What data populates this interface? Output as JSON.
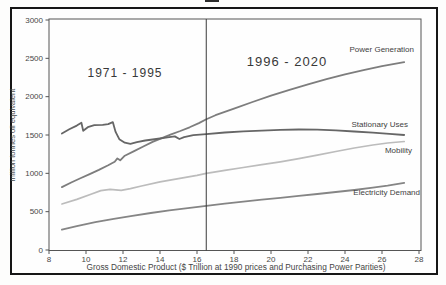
{
  "figure": {
    "cropped_top_fragment": "",
    "border_color": "#161616"
  },
  "chart_data": {
    "type": "line",
    "title": "",
    "xlabel": "Gross Domestic Product ($ Trillion at 1990 prices and Purchasing Power Parities)",
    "ylabel": "million tonnes oil equivalent",
    "xlim": [
      8,
      28
    ],
    "ylim": [
      0,
      3000
    ],
    "x_ticks": [
      8,
      10,
      12,
      14,
      16,
      18,
      20,
      22,
      24,
      26,
      28
    ],
    "y_ticks": [
      0,
      500,
      1000,
      1500,
      2000,
      2500,
      3000
    ],
    "grid": "off",
    "divider_x": 16.5,
    "annotations": [
      {
        "text": "1971 - 1995"
      },
      {
        "text": "1996 - 2020"
      }
    ],
    "series": [
      {
        "name": "Power Generation",
        "color": "#7d7d7d",
        "width": 1.8,
        "points": [
          [
            8.7,
            820
          ],
          [
            9.2,
            880
          ],
          [
            9.7,
            935
          ],
          [
            10.2,
            990
          ],
          [
            10.7,
            1045
          ],
          [
            11.2,
            1105
          ],
          [
            11.55,
            1150
          ],
          [
            11.7,
            1195
          ],
          [
            11.85,
            1170
          ],
          [
            12.1,
            1230
          ],
          [
            12.6,
            1290
          ],
          [
            13.1,
            1350
          ],
          [
            13.6,
            1410
          ],
          [
            14.1,
            1460
          ],
          [
            14.6,
            1508
          ],
          [
            15.1,
            1552
          ],
          [
            15.6,
            1600
          ],
          [
            16.1,
            1655
          ],
          [
            16.5,
            1705
          ],
          [
            17,
            1758
          ],
          [
            18,
            1845
          ],
          [
            19,
            1930
          ],
          [
            20,
            2012
          ],
          [
            21,
            2090
          ],
          [
            22,
            2160
          ],
          [
            23,
            2228
          ],
          [
            24,
            2290
          ],
          [
            25,
            2345
          ],
          [
            26,
            2398
          ],
          [
            26.6,
            2425
          ],
          [
            27.2,
            2450
          ]
        ]
      },
      {
        "name": "Stationary Uses",
        "color": "#666666",
        "width": 1.8,
        "points": [
          [
            8.7,
            1520
          ],
          [
            9.1,
            1575
          ],
          [
            9.5,
            1622
          ],
          [
            9.75,
            1660
          ],
          [
            9.85,
            1555
          ],
          [
            10.1,
            1602
          ],
          [
            10.45,
            1628
          ],
          [
            10.9,
            1632
          ],
          [
            11.2,
            1642
          ],
          [
            11.45,
            1668
          ],
          [
            11.6,
            1540
          ],
          [
            11.8,
            1445
          ],
          [
            12.1,
            1400
          ],
          [
            12.4,
            1385
          ],
          [
            12.75,
            1408
          ],
          [
            13.2,
            1428
          ],
          [
            13.8,
            1448
          ],
          [
            14.4,
            1470
          ],
          [
            14.8,
            1482
          ],
          [
            15.05,
            1448
          ],
          [
            15.3,
            1472
          ],
          [
            15.8,
            1497
          ],
          [
            16.5,
            1512
          ],
          [
            17.5,
            1532
          ],
          [
            18.5,
            1547
          ],
          [
            19.5,
            1558
          ],
          [
            20.5,
            1566
          ],
          [
            21.5,
            1572
          ],
          [
            22.5,
            1570
          ],
          [
            23.5,
            1560
          ],
          [
            24.5,
            1546
          ],
          [
            25.5,
            1530
          ],
          [
            26.4,
            1514
          ],
          [
            27.2,
            1500
          ]
        ]
      },
      {
        "name": "Mobility",
        "color": "#bcbcbc",
        "width": 1.7,
        "points": [
          [
            8.7,
            600
          ],
          [
            9.5,
            660
          ],
          [
            10.3,
            730
          ],
          [
            10.8,
            775
          ],
          [
            11.3,
            790
          ],
          [
            11.9,
            778
          ],
          [
            12.4,
            800
          ],
          [
            13,
            835
          ],
          [
            14,
            888
          ],
          [
            15,
            930
          ],
          [
            16,
            975
          ],
          [
            16.5,
            1000
          ],
          [
            17.5,
            1040
          ],
          [
            18.5,
            1076
          ],
          [
            19.5,
            1112
          ],
          [
            20.5,
            1150
          ],
          [
            21.5,
            1192
          ],
          [
            22.5,
            1236
          ],
          [
            23.5,
            1285
          ],
          [
            24.5,
            1330
          ],
          [
            25.5,
            1370
          ],
          [
            26.3,
            1396
          ],
          [
            27.2,
            1415
          ]
        ]
      },
      {
        "name": "Electricity Demand",
        "color": "#858585",
        "width": 1.8,
        "points": [
          [
            8.7,
            265
          ],
          [
            9.5,
            310
          ],
          [
            10.5,
            362
          ],
          [
            11.5,
            406
          ],
          [
            12.5,
            446
          ],
          [
            13.5,
            482
          ],
          [
            14.5,
            516
          ],
          [
            15.5,
            546
          ],
          [
            16.5,
            576
          ],
          [
            17.5,
            604
          ],
          [
            18.5,
            630
          ],
          [
            19.5,
            656
          ],
          [
            20.5,
            681
          ],
          [
            21.5,
            706
          ],
          [
            22.5,
            731
          ],
          [
            23.5,
            756
          ],
          [
            24.5,
            782
          ],
          [
            25.5,
            812
          ],
          [
            26.3,
            840
          ],
          [
            27.2,
            876
          ]
        ]
      }
    ]
  }
}
